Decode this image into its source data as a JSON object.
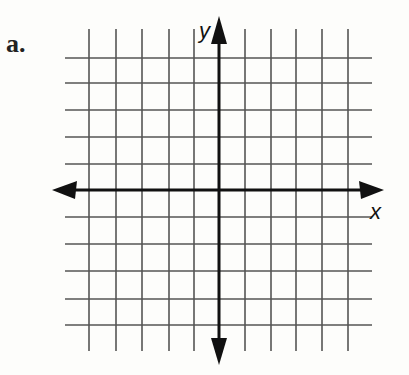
{
  "problem_label": "a.",
  "axes": {
    "x_label": "x",
    "y_label": "y"
  },
  "grid": {
    "vertical_lines": [
      89,
      116,
      142,
      169,
      194,
      245,
      271,
      296,
      322,
      348
    ],
    "horizontal_lines": [
      58,
      83,
      110,
      137,
      164,
      217,
      244,
      271,
      299,
      325
    ],
    "x_axis_y": 190,
    "y_axis_x": 219,
    "line_color": "#555555",
    "axis_color": "#111111"
  }
}
